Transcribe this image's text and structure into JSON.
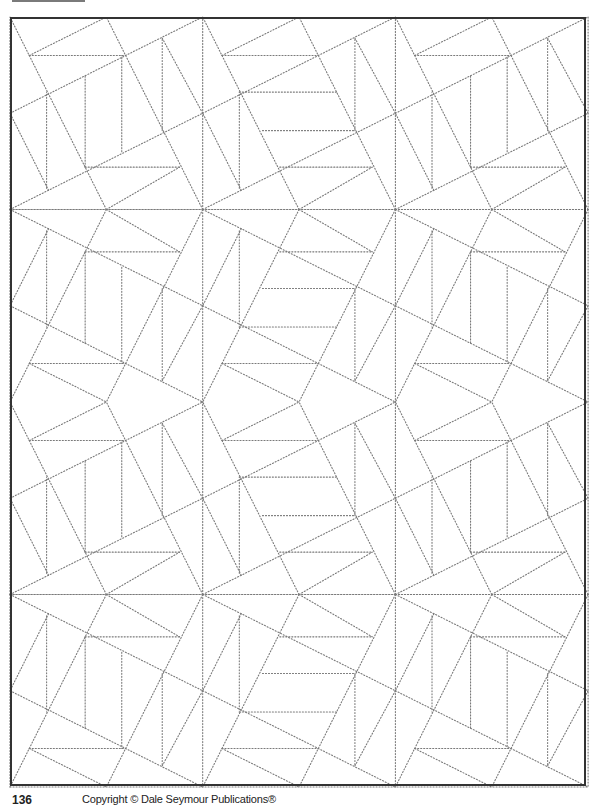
{
  "page": {
    "page_number": "136",
    "copyright": "Copyright © Dale Seymour Publications®"
  },
  "pattern": {
    "line_color": "#7a7a7a",
    "frame_color": "#333333",
    "origin": [
      10,
      17
    ],
    "cell_size": [
      192.7,
      192.5
    ],
    "rows": 4,
    "cols": 3,
    "row_flips": [
      true,
      false,
      true,
      false
    ],
    "col_variants": [
      "B",
      "A",
      "B"
    ],
    "big_lines": [
      [
        0,
        0,
        1,
        0
      ],
      [
        0,
        0,
        0,
        1
      ],
      [
        0,
        0,
        1,
        0.5
      ],
      [
        0.5,
        0,
        0,
        1
      ],
      [
        1,
        0,
        0.5,
        1
      ],
      [
        0,
        0.5,
        1,
        1
      ]
    ],
    "variants": {
      "A": [
        [
          0.5,
          0,
          0.88,
          0.22
        ],
        [
          0.2,
          0.1,
          0,
          0.5
        ],
        [
          0.19,
          0.11,
          0.19,
          0.61
        ],
        [
          0.4,
          0.22,
          0.88,
          0.22
        ],
        [
          0.31,
          0.41,
          0.79,
          0.41
        ],
        [
          0.79,
          0.41,
          0.79,
          0.89
        ],
        [
          0.79,
          0.89,
          1,
          0.5
        ],
        [
          0.19,
          0.61,
          0.7,
          0.61
        ],
        [
          0.1,
          0.8,
          0.6,
          0.8
        ],
        [
          0.1,
          0.8,
          0.5,
          1
        ]
      ],
      "B": [
        [
          0.5,
          0,
          0.88,
          0.22
        ],
        [
          0.2,
          0.1,
          0,
          0.5
        ],
        [
          0.19,
          0.11,
          0.19,
          0.61
        ],
        [
          0.39,
          0.22,
          0.39,
          0.7
        ],
        [
          0.58,
          0.3,
          0.58,
          0.8
        ],
        [
          0.79,
          0.41,
          0.79,
          0.89
        ],
        [
          0.39,
          0.22,
          0.88,
          0.22
        ],
        [
          0.1,
          0.8,
          0.6,
          0.8
        ],
        [
          0.79,
          0.89,
          1,
          0.5
        ],
        [
          0.1,
          0.8,
          0.5,
          1
        ]
      ]
    }
  }
}
